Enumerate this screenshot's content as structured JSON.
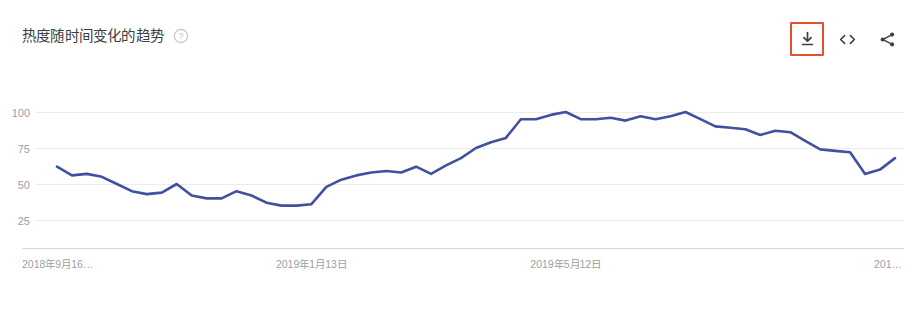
{
  "header": {
    "title": "热度随时间变化的趋势",
    "help_icon": "help-circle-icon"
  },
  "toolbar": {
    "buttons": [
      {
        "name": "download-button",
        "icon": "download-icon",
        "highlighted": true
      },
      {
        "name": "embed-button",
        "icon": "code-embed-icon",
        "highlighted": false
      },
      {
        "name": "share-button",
        "icon": "share-icon",
        "highlighted": false
      }
    ],
    "highlight_color": "#e8502c"
  },
  "chart_data": {
    "type": "line",
    "title": "热度随时间变化的趋势",
    "xlabel": "",
    "ylabel": "",
    "ylim": [
      0,
      105
    ],
    "grid": true,
    "legend": false,
    "line_color": "#3f51a0",
    "y_ticks": [
      100,
      75,
      50,
      25
    ],
    "x_tick_labels": [
      "2018年9月16…",
      "2019年1月13日",
      "2019年5月12日",
      "201…"
    ],
    "x_tick_positions": [
      0,
      17,
      34,
      51
    ],
    "x": [
      "2018年9月16日",
      "2018年9月23日",
      "2018年9月30日",
      "2018年10月7日",
      "2018年10月14日",
      "2018年10月21日",
      "2018年10月28日",
      "2018年11月4日",
      "2018年11月11日",
      "2018年11月18日",
      "2018年11月25日",
      "2018年12月2日",
      "2018年12月9日",
      "2018年12月16日",
      "2018年12月23日",
      "2018年12月30日",
      "2019年1月6日",
      "2019年1月13日",
      "2019年1月20日",
      "2019年1月27日",
      "2019年2月3日",
      "2019年2月10日",
      "2019年2月17日",
      "2019年2月24日",
      "2019年3月3日",
      "2019年3月10日",
      "2019年3月17日",
      "2019年3月24日",
      "2019年3月31日",
      "2019年4月7日",
      "2019年4月14日",
      "2019年4月21日",
      "2019年4月28日",
      "2019年5月5日",
      "2019年5月12日",
      "2019年5月19日",
      "2019年5月26日",
      "2019年6月2日",
      "2019年6月9日",
      "2019年6月16日",
      "2019年6月23日",
      "2019年6月30日",
      "2019年7月7日",
      "2019年7月14日",
      "2019年7月21日",
      "2019年7月28日",
      "2019年8月4日",
      "2019年8月11日",
      "2019年8月18日",
      "2019年8月25日",
      "2019年9月1日",
      "2019年9月8日"
    ],
    "values": [
      62,
      56,
      57,
      55,
      50,
      45,
      43,
      44,
      50,
      42,
      40,
      40,
      45,
      42,
      37,
      35,
      35,
      36,
      48,
      53,
      56,
      58,
      59,
      58,
      62,
      57,
      63,
      68,
      75,
      79,
      82,
      95,
      95,
      98,
      100,
      95,
      95,
      96,
      94,
      97,
      95,
      97,
      100,
      95,
      90,
      89,
      88,
      84,
      87,
      86,
      80,
      74
    ],
    "tail_values": [
      73,
      72,
      57,
      60,
      68
    ],
    "min_value": 35,
    "max_value": 100
  }
}
